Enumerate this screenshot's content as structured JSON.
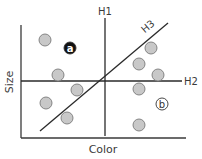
{
  "diagram": {
    "x_axis_label": "Color",
    "y_axis_label": "Size",
    "lines": [
      {
        "id": "H1",
        "label": "H1",
        "x1": 105,
        "y1": 18,
        "x2": 105,
        "y2": 136,
        "label_x": 105,
        "label_y": 15
      },
      {
        "id": "H2",
        "label": "H2",
        "x1": 21,
        "y1": 81,
        "x2": 182,
        "y2": 81,
        "label_x": 191,
        "label_y": 85
      },
      {
        "id": "H3",
        "label": "H3",
        "x1": 40,
        "y1": 131,
        "x2": 168,
        "y2": 23,
        "label_x": 150,
        "label_y": 29
      }
    ],
    "points": [
      {
        "x": 45,
        "y": 40
      },
      {
        "x": 58,
        "y": 75
      },
      {
        "x": 77,
        "y": 90
      },
      {
        "x": 46,
        "y": 103
      },
      {
        "x": 67,
        "y": 118
      },
      {
        "x": 151,
        "y": 48
      },
      {
        "x": 139,
        "y": 64
      },
      {
        "x": 158,
        "y": 75
      },
      {
        "x": 139,
        "y": 89
      },
      {
        "x": 139,
        "y": 125
      }
    ],
    "labeled_points": [
      {
        "id": "a",
        "label": "a",
        "x": 70,
        "y": 48,
        "fill": "#111111",
        "text_color": "#ffffff"
      },
      {
        "id": "b",
        "label": "b",
        "x": 162,
        "y": 104,
        "fill": "#ffffff",
        "text_color": "#333333"
      }
    ],
    "colors": {
      "axis": "#3a3a3a",
      "line": "#2a2a2a",
      "point_fill": "#c8c8c8",
      "point_stroke": "#7a7a7a"
    }
  }
}
